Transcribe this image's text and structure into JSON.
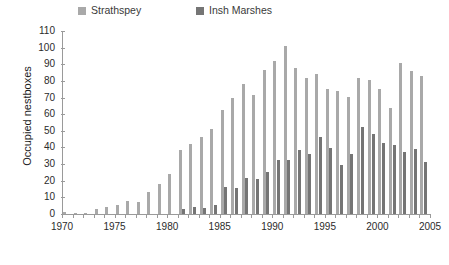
{
  "chart_data": {
    "type": "bar",
    "title": "",
    "subtitle": "",
    "xlabel": "",
    "ylabel": "Occupied nestboxes",
    "xlim": [
      1970,
      2005
    ],
    "ylim": [
      0,
      110
    ],
    "ytick_step": 10,
    "yticks": [
      0,
      10,
      20,
      30,
      40,
      50,
      60,
      70,
      80,
      90,
      100,
      110
    ],
    "xticks_labeled": [
      1970,
      1975,
      1980,
      1985,
      1990,
      1995,
      2000,
      2005
    ],
    "xtick_step": 1,
    "grid": false,
    "legend_position": "top",
    "x": [
      1970,
      1971,
      1972,
      1973,
      1974,
      1975,
      1976,
      1977,
      1978,
      1979,
      1980,
      1981,
      1982,
      1983,
      1984,
      1985,
      1986,
      1987,
      1988,
      1989,
      1990,
      1991,
      1992,
      1993,
      1994,
      1995,
      1996,
      1997,
      1998,
      1999,
      2000,
      2001,
      2002,
      2003,
      2004
    ],
    "categories": [
      "1970",
      "1971",
      "1972",
      "1973",
      "1974",
      "1975",
      "1976",
      "1977",
      "1978",
      "1979",
      "1980",
      "1981",
      "1982",
      "1983",
      "1984",
      "1985",
      "1986",
      "1987",
      "1988",
      "1989",
      "1990",
      "1991",
      "1992",
      "1993",
      "1994",
      "1995",
      "1996",
      "1997",
      "1998",
      "1999",
      "2000",
      "2001",
      "2002",
      "2003",
      "2004"
    ],
    "series": [
      {
        "name": "Strathspey",
        "color": "#a9a9a9",
        "values": [
          1,
          0.5,
          0.5,
          3,
          4,
          5.5,
          8,
          7,
          13,
          18,
          24,
          38.5,
          42,
          46.5,
          51,
          62.5,
          70,
          78,
          71.5,
          86.5,
          92,
          101,
          88,
          82,
          84,
          75,
          74,
          70.5,
          82,
          80.5,
          75,
          64,
          91,
          86,
          83
        ]
      },
      {
        "name": "Insh Marshes",
        "color": "#757575",
        "values": [
          0,
          0,
          0,
          0,
          0,
          0,
          0,
          0,
          0,
          0,
          0,
          3,
          4.5,
          3.5,
          5.5,
          16.5,
          15.5,
          21.5,
          21,
          25.5,
          32.5,
          32.5,
          38.5,
          36,
          46.5,
          39.5,
          29.5,
          36,
          52.5,
          48,
          42.5,
          41.5,
          37,
          39,
          31.5
        ]
      }
    ]
  },
  "legend": {
    "items": [
      {
        "label": "Strathspey",
        "color": "#a9a9a9"
      },
      {
        "label": "Insh Marshes",
        "color": "#757575"
      }
    ]
  },
  "axes": {
    "y_title": "Occupied nestboxes"
  }
}
